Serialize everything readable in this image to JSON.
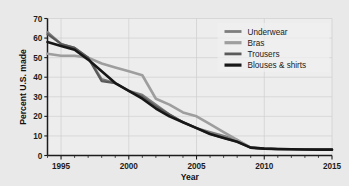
{
  "chart_data": {
    "type": "line",
    "title": "",
    "xlabel": "Year",
    "ylabel": "Percent U.S. made",
    "xlim": [
      1994,
      2015
    ],
    "ylim": [
      0,
      70
    ],
    "grid": true,
    "legend_position": "top-right",
    "x_ticks": [
      "1995",
      "2000",
      "2005",
      "2010",
      "2015"
    ],
    "x_tick_values": [
      1995,
      2000,
      2005,
      2010,
      2015
    ],
    "y_ticks": [
      "0",
      "10",
      "20",
      "30",
      "40",
      "50",
      "60",
      "70"
    ],
    "y_tick_values": [
      0,
      10,
      20,
      30,
      40,
      50,
      60,
      70
    ],
    "x": [
      1994,
      1995,
      1996,
      1997,
      1998,
      1999,
      2000,
      2001,
      2002,
      2003,
      2004,
      2005,
      2006,
      2007,
      2008,
      2009,
      2010,
      2011,
      2012,
      2013,
      2014,
      2015
    ],
    "series": [
      {
        "name": "Underwear",
        "color": "#7d7d7d",
        "width": 2.2,
        "values": [
          63,
          57,
          55,
          50,
          39,
          37,
          33,
          31,
          26,
          21,
          17,
          14,
          12,
          10,
          8,
          4,
          3.5,
          3.3,
          3.2,
          3.1,
          3.0,
          3.0
        ]
      },
      {
        "name": "Bras",
        "color": "#9e9e9e",
        "width": 2.6,
        "values": [
          52,
          51,
          51,
          50,
          47,
          45,
          43,
          41,
          29,
          26,
          22,
          20,
          16,
          12,
          8,
          4,
          3.5,
          3.3,
          3.2,
          3.1,
          3.0,
          3.0
        ]
      },
      {
        "name": "Trousers",
        "color": "#5a5a5a",
        "width": 2.2,
        "values": [
          62,
          57,
          55,
          50,
          38,
          37,
          33,
          30,
          25,
          21,
          17,
          14,
          11,
          9,
          7,
          4,
          3.5,
          3.3,
          3.2,
          3.1,
          3.0,
          3.0
        ]
      },
      {
        "name": "Blouses & shirts",
        "color": "#171717",
        "width": 2.6,
        "values": [
          58,
          56,
          54,
          49,
          43,
          37,
          33,
          29,
          24,
          20,
          17,
          14,
          11,
          9,
          7,
          4,
          3.5,
          3.3,
          3.2,
          3.1,
          3.0,
          3.0
        ]
      }
    ]
  },
  "legend": {
    "items": [
      {
        "label": "Underwear"
      },
      {
        "label": "Bras"
      },
      {
        "label": "Trousers"
      },
      {
        "label": "Blouses & shirts"
      }
    ]
  },
  "axes": {
    "x_title": "Year",
    "y_title": "Percent U.S. made"
  },
  "colors": {
    "background": "#e9e9e9",
    "plot_background": "#ededed",
    "axis": "#1c1c1c",
    "grid": "#cfcfcf"
  }
}
